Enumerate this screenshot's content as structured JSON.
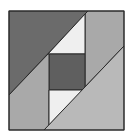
{
  "diagram": {
    "type": "quilt-block",
    "canvas": {
      "width": 132,
      "height": 140,
      "background": "#ffffff"
    },
    "outline_color": "#2a2a2a",
    "pieces": [
      {
        "name": "top-left-dark-triangle",
        "points": "9,11 88,11 9,95",
        "fill": "#6b6b6b"
      },
      {
        "name": "top-right-medium-region",
        "points": "88,11 124,11 124,46 85,87 85,14",
        "fill": "#a9a9a9"
      },
      {
        "name": "top-white-triangle",
        "points": "85,14 85,54 48,54",
        "fill": "#efefef"
      },
      {
        "name": "center-dark-square",
        "points": "49,54 85,54 85,90 49,90",
        "fill": "#5f5f5f"
      },
      {
        "name": "left-medium-region",
        "points": "9,95 48,54 49,54 49,125 44,130 9,130",
        "fill": "#a9a9a9"
      },
      {
        "name": "bottom-white-triangle",
        "points": "49,90 83,90 49,125",
        "fill": "#efefef"
      },
      {
        "name": "bottom-right-light-triangle",
        "points": "44,130 124,46 124,130",
        "fill": "#b9b9b9"
      }
    ]
  }
}
